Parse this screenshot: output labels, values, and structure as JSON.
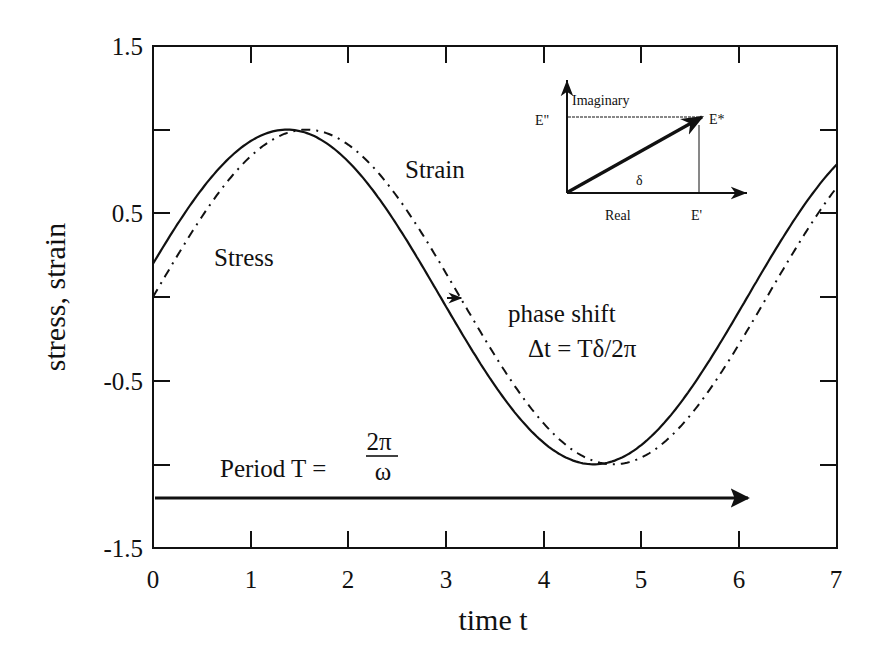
{
  "chart_data": {
    "type": "line",
    "title": "",
    "xlabel": "time t",
    "ylabel": "stress,  strain",
    "xlim": [
      0,
      7
    ],
    "ylim": [
      -1.5,
      1.5
    ],
    "grid": false,
    "x_ticks": [
      0,
      1,
      2,
      3,
      4,
      5,
      6,
      7
    ],
    "x_tick_labels": [
      "0",
      "1",
      "2",
      "3",
      "4",
      "5",
      "6",
      "7"
    ],
    "y_ticks": [
      1.5,
      1.0,
      0.5,
      0.0,
      -0.5,
      -1.0,
      -1.5
    ],
    "y_tick_labels": [
      "1.5",
      "",
      "0.5",
      "",
      "-0.5",
      "",
      "-1.5"
    ],
    "series": [
      {
        "name": "Stress",
        "style": "solid",
        "function": "sin(t + 0.2)",
        "x": [
          0,
          0.5,
          1,
          1.37,
          2,
          2.5,
          3,
          3.5,
          4,
          4.51,
          5,
          5.5,
          6,
          6.5,
          7
        ],
        "values": [
          0.2,
          0.64,
          0.93,
          1.0,
          0.8,
          0.43,
          -0.06,
          -0.54,
          -0.89,
          -1.0,
          -0.88,
          -0.53,
          -0.06,
          0.43,
          0.79
        ]
      },
      {
        "name": "Strain",
        "style": "dash-dot",
        "function": "sin(t)",
        "x": [
          0,
          0.5,
          1,
          1.57,
          2,
          2.5,
          3,
          3.5,
          4,
          4.71,
          5,
          5.5,
          6,
          6.5,
          7
        ],
        "values": [
          0.0,
          0.48,
          0.84,
          1.0,
          0.91,
          0.6,
          0.14,
          -0.35,
          -0.76,
          -1.0,
          -0.96,
          -0.71,
          -0.28,
          0.22,
          0.66
        ]
      }
    ],
    "annotations": {
      "stress_label": "Stress",
      "strain_label": "Strain",
      "phase_shift_line1": "phase shift",
      "phase_shift_line2": "Δt = Tδ/2π",
      "period_label": "Period T =",
      "period_numerator": "2π",
      "period_denominator": "ω"
    },
    "inset": {
      "imaginary_label": "Imaginary",
      "real_label": "Real",
      "e_double_prime": "E\"",
      "e_prime": "E'",
      "e_star": "E*",
      "delta": "δ"
    }
  }
}
